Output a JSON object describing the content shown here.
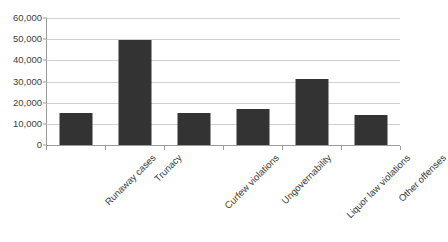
{
  "chart_data": {
    "type": "bar",
    "title": "",
    "subtitle": "",
    "xlabel": "",
    "ylabel": "",
    "ylim": [
      0,
      60000
    ],
    "grid": true,
    "legend": false,
    "legend_position": "none",
    "orientation": "vertical",
    "bar_color": "#333333",
    "background_color": "#ffffff",
    "gridline_color": "#d0d0d0",
    "axis_color": "#9a9a9a",
    "label_rotation_degrees": -45,
    "categories": [
      "Runaway cases",
      "Trunacy",
      "Curfew violations",
      "Ungovernability",
      "Liquor law violations",
      "Other offenses"
    ],
    "values": [
      15000,
      49500,
      15000,
      17000,
      31000,
      14000
    ],
    "y_ticks": [
      0,
      10000,
      20000,
      30000,
      40000,
      50000,
      60000
    ],
    "y_tick_labels": [
      "0",
      "10,000",
      "20,000",
      "30,000",
      "40,000",
      "50,000",
      "60,000"
    ]
  }
}
